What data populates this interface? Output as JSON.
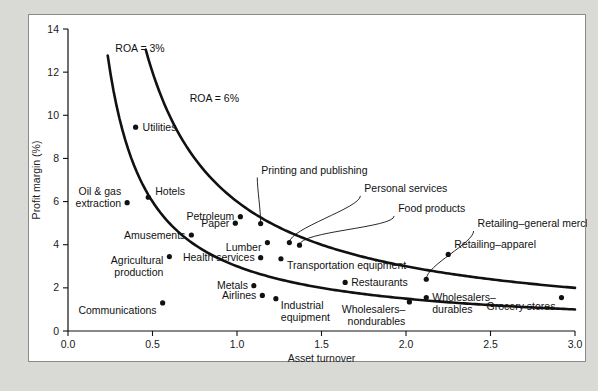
{
  "chart_data": {
    "type": "scatter",
    "title": "",
    "xlabel": "Asset turnover",
    "ylabel": "Profit margin (%)",
    "xlim": [
      0.0,
      3.0
    ],
    "ylim": [
      0,
      14
    ],
    "xticks": [
      "0.0",
      "0.5",
      "1.0",
      "1.5",
      "2.0",
      "2.5",
      "3.0"
    ],
    "xtick_values": [
      0.0,
      0.5,
      1.0,
      1.5,
      2.0,
      2.5,
      3.0
    ],
    "yticks": [
      "0",
      "2",
      "4",
      "6",
      "8",
      "10",
      "12",
      "14"
    ],
    "ytick_values": [
      0,
      2,
      4,
      6,
      8,
      10,
      12,
      14
    ],
    "grid": false,
    "legend": "none",
    "points": [
      {
        "label": "Utilities",
        "x": 0.4,
        "y": 9.45,
        "label_dx": 7,
        "label_dy": 3.5,
        "anchor": "start"
      },
      {
        "label": "Oil & gas\nextraction",
        "x": 0.35,
        "y": 5.95,
        "label_dx": -6,
        "label_dy": -8,
        "anchor": "end"
      },
      {
        "label": "Hotels",
        "x": 0.475,
        "y": 6.2,
        "label_dx": 7,
        "label_dy": -2,
        "anchor": "start"
      },
      {
        "label": "Amusements",
        "x": 0.73,
        "y": 4.45,
        "label_dx": -6,
        "label_dy": 3.5,
        "anchor": "end"
      },
      {
        "label": "Agricultural\nproduction",
        "x": 0.6,
        "y": 3.45,
        "label_dx": -6,
        "label_dy": 7,
        "anchor": "end"
      },
      {
        "label": "Communications",
        "x": 0.56,
        "y": 1.3,
        "label_dx": -6,
        "label_dy": 11,
        "anchor": "end"
      },
      {
        "label": "Petroleum",
        "x": 1.02,
        "y": 5.3,
        "label_dx": -6,
        "label_dy": 3.5,
        "anchor": "end"
      },
      {
        "label": "Paper",
        "x": 0.99,
        "y": 5.0,
        "label_dx": -6,
        "label_dy": 3.5,
        "anchor": "end"
      },
      {
        "label": "Health services",
        "x": 1.14,
        "y": 3.4,
        "label_dx": -6,
        "label_dy": 3.5,
        "anchor": "end"
      },
      {
        "label": "Lumber",
        "x": 1.18,
        "y": 4.1,
        "label_dx": -6,
        "label_dy": 8,
        "anchor": "end"
      },
      {
        "label": "Metals",
        "x": 1.1,
        "y": 2.1,
        "label_dx": -6,
        "label_dy": 3.5,
        "anchor": "end"
      },
      {
        "label": "Airlines",
        "x": 1.15,
        "y": 1.65,
        "label_dx": -6,
        "label_dy": 3.5,
        "anchor": "end"
      },
      {
        "label": "Industrial\nequipment",
        "x": 1.23,
        "y": 1.5,
        "label_dx": 5,
        "label_dy": 10,
        "anchor": "start"
      },
      {
        "label": "Transportation equipment",
        "x": 1.26,
        "y": 3.35,
        "label_dx": 6,
        "label_dy": 10,
        "anchor": "start"
      },
      {
        "label": "Restaurants",
        "x": 1.64,
        "y": 2.25,
        "label_dx": 6,
        "label_dy": 3.5,
        "anchor": "start"
      },
      {
        "label": "Wholesalers–\nnondurables",
        "x": 2.02,
        "y": 1.35,
        "label_dx": -4,
        "label_dy": 11,
        "anchor": "end"
      },
      {
        "label": "Wholesalers–\ndurables",
        "x": 2.12,
        "y": 1.55,
        "label_dx": 6,
        "label_dy": 3,
        "anchor": "start"
      },
      {
        "label": "Retailing–apparel",
        "x": 2.25,
        "y": 3.55,
        "label_dx": 6,
        "label_dy": -6,
        "anchor": "start"
      },
      {
        "label": "Grocery stores",
        "x": 2.92,
        "y": 1.55,
        "label_dx": -6,
        "label_dy": 12,
        "anchor": "end"
      }
    ],
    "leader_points": [
      {
        "label": "Printing and publishing",
        "x": 1.14,
        "y": 4.98,
        "tip_x": 1.14,
        "tip_y": 4.98,
        "text_x": 1.12,
        "text_y": 7.3
      },
      {
        "label": "Personal services",
        "x": 1.31,
        "y": 4.1,
        "tip_x": 1.31,
        "tip_y": 4.1,
        "text_x": 1.73,
        "text_y": 6.45
      },
      {
        "label": "Food products",
        "x": 1.37,
        "y": 3.98,
        "tip_x": 1.37,
        "tip_y": 3.98,
        "text_x": 1.93,
        "text_y": 5.52
      },
      {
        "label": "Retailing–general merchandise",
        "x": 2.12,
        "y": 2.4,
        "tip_x": 2.12,
        "tip_y": 2.4,
        "text_x": 2.4,
        "text_y": 4.82
      }
    ],
    "annotations": [
      {
        "text": "ROA = 3%",
        "x": 0.28,
        "y": 12.95
      },
      {
        "text": "ROA = 6%",
        "x": 0.72,
        "y": 10.6
      }
    ],
    "iso_curves": [
      {
        "name": "ROA = 3%",
        "roa": 3,
        "x_start": 0.235,
        "x_end": 3.0
      },
      {
        "name": "ROA = 6%",
        "roa": 6,
        "x_start": 0.46,
        "x_end": 3.0
      }
    ]
  },
  "colors": {
    "page_background": "#d9d9d6",
    "panel_background": "#ffffff",
    "ink": "#111111",
    "frame_border": "#8a8a8a"
  }
}
